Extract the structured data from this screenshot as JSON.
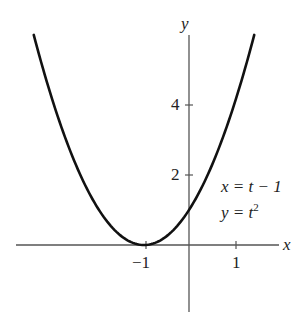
{
  "chart_data": {
    "type": "line",
    "title": "",
    "xlabel": "x",
    "ylabel": "y",
    "series": [
      {
        "name": "parametric curve x = t - 1, y = t^2",
        "equation_x": "x = t - 1",
        "equation_y": "y = t^2",
        "t_range": [
          -2.45,
          2.45
        ],
        "x": [
          -3.45,
          -3,
          -2.5,
          -2,
          -1.5,
          -1,
          -0.5,
          0,
          0.5,
          1,
          1.45
        ],
        "y": [
          6.0,
          4,
          2.25,
          1,
          0.25,
          0,
          0.25,
          1,
          2.25,
          4,
          6.0
        ]
      }
    ],
    "x_ticks": [
      {
        "value": -1,
        "label": "−1"
      },
      {
        "value": 1,
        "label": "1"
      }
    ],
    "y_ticks": [
      {
        "value": 2,
        "label": "2"
      },
      {
        "value": 4,
        "label": "4"
      }
    ],
    "xlim": [
      -4,
      2
    ],
    "ylim": [
      -2,
      6
    ],
    "grid": false,
    "annotations": [
      "x = t − 1",
      "y = t²"
    ]
  },
  "labels": {
    "x_axis": "x",
    "y_axis": "y",
    "tick_x_neg1": "−1",
    "tick_x_1": "1",
    "tick_y_2": "2",
    "tick_y_4": "4",
    "eq1": "x = t − 1",
    "eq2_base": "y = t",
    "eq2_exp": "2"
  }
}
